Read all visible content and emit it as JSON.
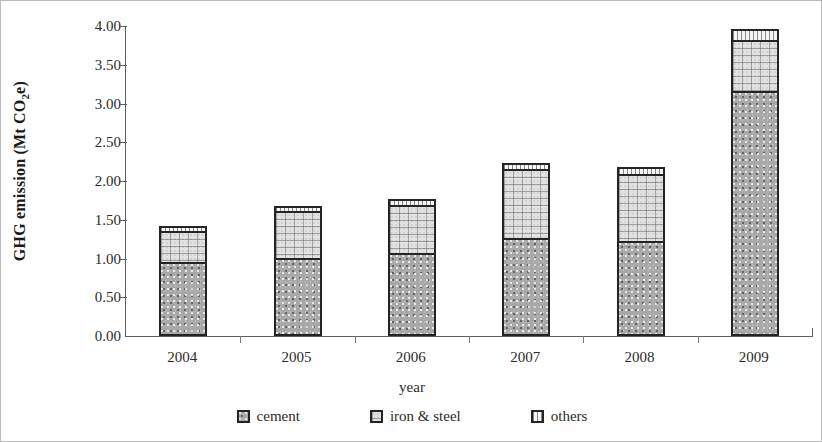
{
  "chart_data": {
    "type": "bar",
    "stacked": true,
    "title": "",
    "xlabel": "year",
    "ylabel": "GHG emission (Mt CO2e)",
    "ylabel_rich": {
      "prefix": "GHG emission (Mt CO",
      "sub": "2",
      "suffix": "e)"
    },
    "categories": [
      "2004",
      "2005",
      "2006",
      "2007",
      "2008",
      "2009"
    ],
    "series": [
      {
        "name": "cement",
        "values": [
          0.96,
          1.01,
          1.07,
          1.27,
          1.23,
          3.16
        ]
      },
      {
        "name": "iron & steel",
        "values": [
          0.42,
          0.63,
          0.65,
          0.91,
          0.89,
          0.69
        ]
      },
      {
        "name": "others",
        "values": [
          0.1,
          0.1,
          0.11,
          0.11,
          0.12,
          0.17
        ]
      }
    ],
    "totals": [
      1.48,
      1.74,
      1.83,
      2.29,
      2.24,
      4.02
    ],
    "ylim": [
      0.0,
      4.0
    ],
    "ytick_step": 0.5,
    "ytick_labels": [
      "0.00",
      "0.50",
      "1.00",
      "1.50",
      "2.00",
      "2.50",
      "3.00",
      "3.50",
      "4.00"
    ],
    "ytick_values": [
      0.0,
      0.5,
      1.0,
      1.5,
      2.0,
      2.5,
      3.0,
      3.5,
      4.0
    ],
    "grid": false,
    "legend_position": "bottom",
    "legend": [
      "cement",
      "iron & steel",
      "others"
    ],
    "colors": {
      "cement": "#a8a8a8",
      "iron_steel": "#e2e2e2",
      "others": "#f6f6f6",
      "outline": "#242424",
      "axis": "#5e5e5e",
      "text": "#2b2b2b"
    }
  }
}
